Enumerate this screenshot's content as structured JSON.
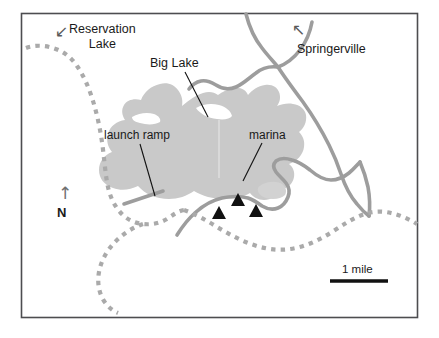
{
  "map": {
    "title": "Big Lake area map",
    "frame": {
      "x": 21,
      "y": 13,
      "width": 397,
      "height": 305,
      "border_color": "#4d4d50"
    },
    "background_color": "#ffffff",
    "water_color": "#c8c8c8",
    "road_color": "#9a9a9a",
    "boundary_color": "#a8a8a8",
    "label_color": "#1a1a1a",
    "marker_color": "#111111"
  },
  "labels": {
    "reservation_lake": "Reservation\nLake",
    "reservation_lake_line1": "Reservation",
    "reservation_lake_line2": "Lake",
    "springerville": "Springerville",
    "big_lake": "Big Lake",
    "launch_ramp": "launch ramp",
    "marina": "marina",
    "north": "N",
    "scale": "1 mile"
  },
  "icons": {
    "reservation_arrow": "↙",
    "springerville_arrow": "↖",
    "north_arrow": "↑",
    "campground_marker": "triangle"
  },
  "features": {
    "lake": {
      "name": "Big Lake",
      "type": "water-body"
    },
    "boundary": {
      "name": "reservation boundary",
      "type": "dashed-line"
    },
    "roads": {
      "name": "roads",
      "type": "line"
    },
    "campgrounds": [
      {
        "name": "campground-1",
        "x": 219,
        "y": 215
      },
      {
        "name": "campground-2",
        "x": 238,
        "y": 202
      },
      {
        "name": "campground-3",
        "x": 256,
        "y": 213
      }
    ],
    "launch_ramp": {
      "name": "launch ramp",
      "type": "ramp-segment"
    },
    "marina": {
      "name": "marina",
      "type": "marina-inlet"
    },
    "scale_bar": {
      "label": "1 mile",
      "length_px": 58
    }
  }
}
